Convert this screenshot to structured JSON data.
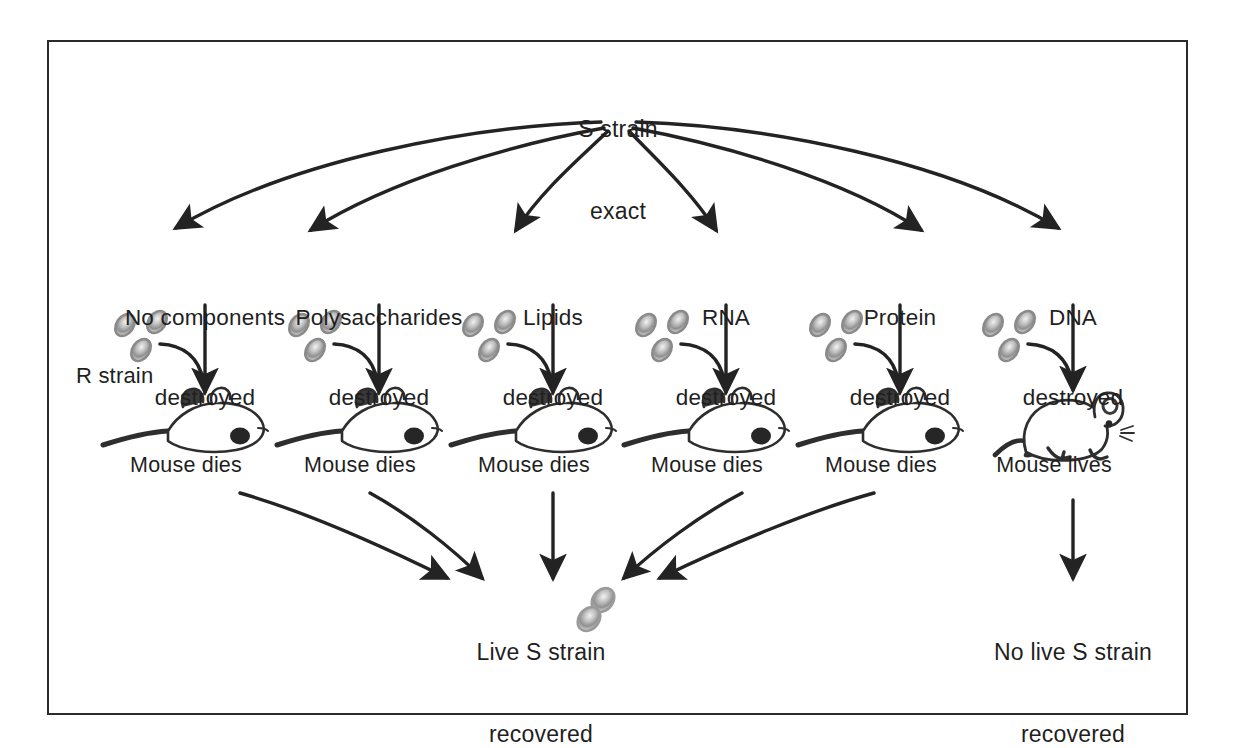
{
  "figure": {
    "title_label": "S strain\nexact",
    "source_label_line1": "S strain",
    "source_label_line2": "exact",
    "frame_color": "#2b2b2b",
    "ink_color": "#1f1f1f",
    "cell_color": "#8a8a8a",
    "inoculum_label": "R strain",
    "columns": [
      {
        "treatment_line1": "No components",
        "treatment_line2": "destroyed",
        "outcome": "Mouse dies"
      },
      {
        "treatment_line1": "Polysaccharides",
        "treatment_line2": "destroyed",
        "outcome": "Mouse dies"
      },
      {
        "treatment_line1": "Lipids",
        "treatment_line2": "destroyed",
        "outcome": "Mouse dies"
      },
      {
        "treatment_line1": "RNA",
        "treatment_line2": "destroyed",
        "outcome": "Mouse dies"
      },
      {
        "treatment_line1": "Protein",
        "treatment_line2": "destroyed",
        "outcome": "Mouse dies"
      },
      {
        "treatment_line1": "DNA",
        "treatment_line2": "destroyed",
        "outcome": "Mouse lives"
      }
    ],
    "results": {
      "left_line1": "Live S strain",
      "left_line2": "recovered",
      "right_line1": "No live S strain",
      "right_line2": "recovered"
    }
  }
}
